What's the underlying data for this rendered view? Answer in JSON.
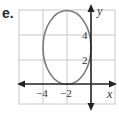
{
  "problem_label": "e.",
  "graph": {
    "x_axis_label": "x",
    "y_axis_label": "y",
    "x_ticks": [
      {
        "value": -4,
        "label": "−4"
      },
      {
        "value": -2,
        "label": "−2"
      }
    ],
    "y_ticks": [
      {
        "value": 2,
        "label": "2"
      },
      {
        "value": 4,
        "label": "4"
      }
    ],
    "grid": {
      "x_range": [
        -6,
        2
      ],
      "y_range": [
        -1.6,
        6
      ],
      "spacing": 2
    },
    "ellipse": {
      "center": [
        -2,
        3
      ],
      "horizontal_semi_axis": 2,
      "vertical_semi_axis": 3
    },
    "colors": {
      "grid": "#c8c8c8",
      "axes": "#222222",
      "ellipse": "#7a7a7a"
    }
  }
}
